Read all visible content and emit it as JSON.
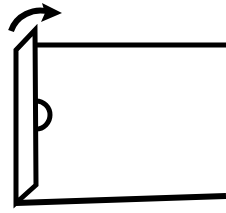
{
  "figure": {
    "style": "black line art on white background",
    "background_color": "#ffffff",
    "line_color": "#000000",
    "canvas": {
      "width": 226,
      "height": 213
    }
  },
  "elements": {
    "door_panel": {
      "name": "door-panel",
      "shape": "parallelogram",
      "stroke_width": 5,
      "points": "35,30 16,50 16,203 36,185",
      "corners": {
        "top_right": [
          35,
          30
        ],
        "top_left": [
          16,
          50
        ],
        "bottom_left": [
          16,
          203
        ],
        "bottom_right": [
          36,
          185
        ]
      }
    },
    "door_handle": {
      "name": "door-handle",
      "shape": "semicircle",
      "center": [
        36,
        115
      ],
      "radius": 14,
      "stroke_width": 5,
      "bulge": "right"
    },
    "top_wall_line": {
      "name": "top-wall-line",
      "shape": "line",
      "from": [
        35,
        45
      ],
      "to": [
        226,
        45
      ],
      "stroke_width": 5
    },
    "bottom_floor_line": {
      "name": "bottom-floor-line",
      "shape": "line",
      "from": [
        16,
        203
      ],
      "to": [
        226,
        196
      ],
      "stroke_width": 6
    },
    "swing_arrow": {
      "name": "swing-arrow",
      "shape": "curved-arrow",
      "direction": "up-right",
      "tail": [
        11,
        31
      ],
      "head_tip": [
        62,
        13
      ],
      "stroke_width": 6,
      "arrowhead": "solid-triangle"
    }
  },
  "labels": {
    "none": ""
  }
}
